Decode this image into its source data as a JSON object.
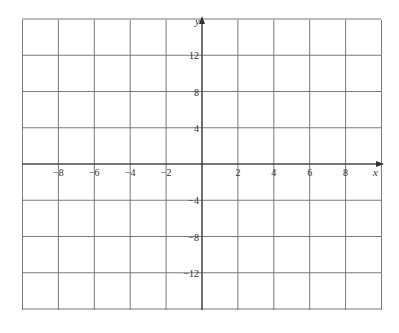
{
  "chart_data": {
    "type": "grid",
    "title": "",
    "xlabel": "x",
    "ylabel": "y",
    "xlim": [
      -10,
      10
    ],
    "ylim": [
      -16,
      16
    ],
    "x_grid_step": 2,
    "y_grid_step": 4,
    "x_tick_labels": [
      "−8",
      "−6",
      "−4",
      "−2",
      "2",
      "4",
      "6",
      "8"
    ],
    "x_tick_values": [
      -8,
      -6,
      -4,
      -2,
      2,
      4,
      6,
      8
    ],
    "y_tick_labels": [
      "12",
      "8",
      "4",
      "−4",
      "−8",
      "−12"
    ],
    "y_tick_values": [
      12,
      8,
      4,
      -4,
      -8,
      -12
    ],
    "grid": true,
    "series": []
  },
  "labels": {
    "x_axis": "x",
    "y_axis": "y"
  }
}
